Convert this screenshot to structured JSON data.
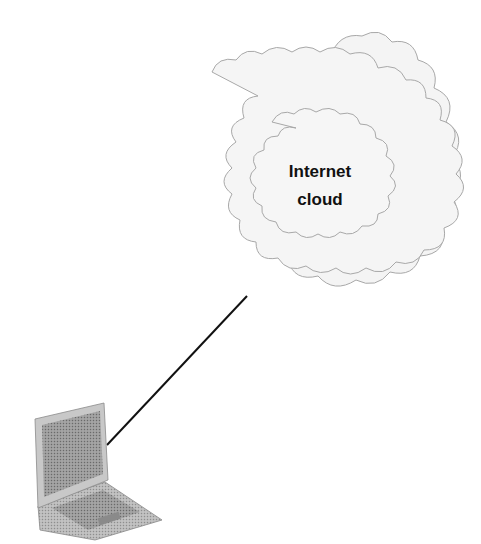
{
  "diagram": {
    "cloud": {
      "label_line1": "Internet",
      "label_line2": "cloud",
      "fill": "#f3f3f3",
      "stroke": "#a8a8a8"
    },
    "connection": {
      "from": "laptop",
      "to": "internet-cloud",
      "color": "#111111"
    },
    "laptop": {
      "icon": "laptop-icon"
    }
  }
}
